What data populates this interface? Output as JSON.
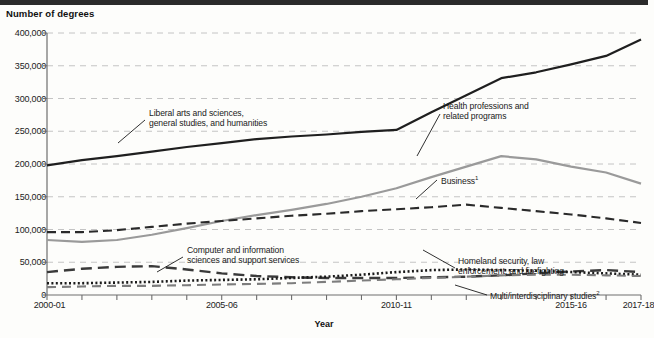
{
  "figure": {
    "y_axis_title": "Number of degrees",
    "x_axis_title": "Year"
  },
  "chart_data": {
    "type": "line",
    "title": "Number of degrees",
    "xlabel": "Year",
    "ylabel": "Number of degrees",
    "ylim": [
      0,
      400000
    ],
    "grid": true,
    "legend_position": "inline-annotations",
    "categories": [
      "2000-01",
      "2001-02",
      "2002-03",
      "2003-04",
      "2004-05",
      "2005-06",
      "2006-07",
      "2007-08",
      "2008-09",
      "2009-10",
      "2010-11",
      "2011-12",
      "2012-13",
      "2013-14",
      "2014-15",
      "2015-16",
      "2016-17",
      "2017-18"
    ],
    "x_tick_labels": [
      "2000-01",
      "2005-06",
      "2010-11",
      "2015-16",
      "2017-18"
    ],
    "y_tick_labels": [
      "0",
      "50,000",
      "100,000",
      "150,000",
      "200,000",
      "250,000",
      "300,000",
      "350,000",
      "400,000"
    ],
    "y_ticks": [
      0,
      50000,
      100000,
      150000,
      200000,
      250000,
      300000,
      350000,
      400000
    ],
    "series": [
      {
        "name": "Liberal arts and sciences, general studies, and humanities",
        "style": "solid-dark",
        "color": "#1f1f1f",
        "values": [
          198000,
          206000,
          212000,
          219000,
          226000,
          232000,
          238000,
          242000,
          245000,
          249000,
          252000,
          279000,
          305000,
          331000,
          340000,
          352000,
          365000,
          390000
        ]
      },
      {
        "name": "Health professions and related programs",
        "style": "solid-gray",
        "color": "#9a9a9a",
        "values": [
          84000,
          81000,
          84000,
          92000,
          102000,
          113000,
          122000,
          130000,
          139000,
          150000,
          163000,
          180000,
          196000,
          212000,
          207000,
          196000,
          187000,
          170000
        ]
      },
      {
        "name": "Business",
        "footnote": "1",
        "style": "dashed-dark",
        "color": "#2a2a2a",
        "values": [
          96000,
          96000,
          99000,
          104000,
          109000,
          113000,
          117000,
          121000,
          124000,
          128000,
          131000,
          134000,
          138000,
          133000,
          128000,
          123000,
          117000,
          110000
        ]
      },
      {
        "name": "Computer and information sciences and support services",
        "style": "dashed-long",
        "color": "#3a3a3a",
        "values": [
          35000,
          40000,
          43000,
          44000,
          39000,
          33000,
          29000,
          27000,
          26000,
          26000,
          26000,
          27000,
          28000,
          30000,
          33000,
          36000,
          38000,
          35000
        ]
      },
      {
        "name": "Homeland security, law enforcement, and firefighting",
        "style": "dotted",
        "color": "#1a1a1a",
        "values": [
          18000,
          18000,
          19000,
          20000,
          22000,
          23000,
          24000,
          26000,
          28000,
          31000,
          35000,
          38000,
          39000,
          38000,
          37000,
          35000,
          33000,
          31000
        ]
      },
      {
        "name": "Multi/interdisciplinary studies",
        "footnote": "2",
        "style": "dashed-gray",
        "color": "#7d7d7d",
        "values": [
          12000,
          13000,
          14000,
          14000,
          15000,
          16000,
          17000,
          18000,
          20000,
          22000,
          24000,
          26000,
          28000,
          30000,
          31000,
          31000,
          30000,
          29000
        ]
      }
    ],
    "annotations": [
      {
        "text": "Liberal arts and sciences,\ngeneral studies, and humanities",
        "series": "Liberal arts and sciences, general studies, and humanities"
      },
      {
        "text": "Health professions and\nrelated programs",
        "series": "Health professions and related programs"
      },
      {
        "text": "Business",
        "footnote": "1",
        "series": "Business"
      },
      {
        "text": "Computer and information\nsciences and support services",
        "series": "Computer and information sciences and support services"
      },
      {
        "text": "Homeland security, law\nenforcement, and firefighting",
        "series": "Homeland security, law enforcement, and firefighting"
      },
      {
        "text": "Multi/interdisciplinary studies",
        "footnote": "2",
        "series": "Multi/interdisciplinary studies"
      }
    ]
  }
}
